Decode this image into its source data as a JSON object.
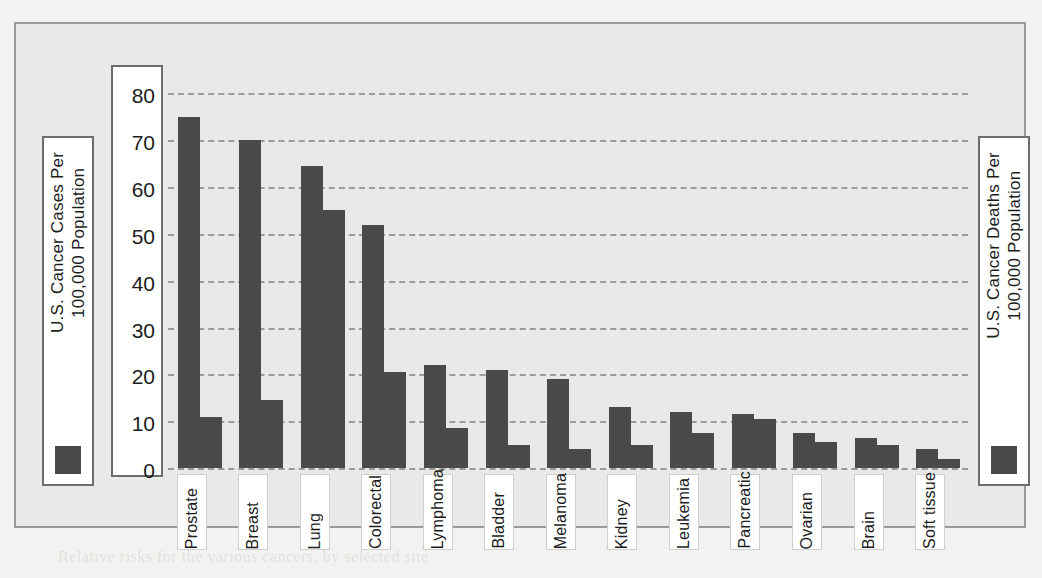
{
  "legend": {
    "left": {
      "label": "U.S. Cancer Cases Per\n100,000 Population",
      "swatch_color": "#4a4a4a"
    },
    "right": {
      "label": "U.S. Cancer Deaths Per\n100,000 Population",
      "swatch_color": "#4a4a4a"
    }
  },
  "axis": {
    "y_ticks": [
      "80",
      "70",
      "60",
      "50",
      "40",
      "30",
      "20",
      "10",
      "0"
    ]
  },
  "chart_data": {
    "type": "bar",
    "title": "",
    "subtitle": "",
    "xlabel": "",
    "ylabel": "U.S. Cancer Cases / Deaths Per 100,000 Population",
    "ylim": [
      0,
      85
    ],
    "ytick_step": 10,
    "grid": true,
    "grid_style": "dashed horizontal",
    "legend_position": "left and right vertical side panels",
    "bar_color": "#4a4a4a",
    "plot_background": "#e9e9e7",
    "categories": [
      "Prostate",
      "Breast",
      "Lung",
      "Colorectal",
      "Lymphoma",
      "Bladder",
      "Melanoma",
      "Kidney",
      "Leukemia",
      "Pancreatic",
      "Ovarian",
      "Brain",
      "Soft tissue"
    ],
    "series": [
      {
        "name": "U.S. Cancer Cases Per 100,000 Population",
        "values": [
          75,
          70,
          64.5,
          52,
          22,
          21,
          19,
          13,
          12,
          11.5,
          7.5,
          6.5,
          4
        ]
      },
      {
        "name": "U.S. Cancer Deaths Per 100,000 Population",
        "values": [
          11,
          14.5,
          55,
          20.5,
          8.5,
          5,
          4,
          5,
          7.5,
          10.5,
          5.5,
          5,
          2
        ]
      }
    ]
  },
  "ghost_text": {
    "g1": "the Alexander and Taylor cases, the court",
    "g2": "that its archive normal cells in B/C, with",
    "g3": "a general rule, how an author can claim",
    "g4": "copyright in the set. In many cases the",
    "g5": "key to question is proper analysis.",
    "g6": "A standard point of view is that the",
    "g7": "cell from normal cells, and from which",
    "g8": "Relative risks for the various cancers, by selected site"
  }
}
